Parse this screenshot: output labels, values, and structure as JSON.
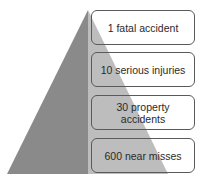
{
  "diagram": {
    "type": "safety-pyramid",
    "colors": {
      "dark": "#8a8a8a",
      "light": "#bdbdbd",
      "border": "#5a5a5a",
      "text": "#2a2a2a"
    },
    "levels": [
      {
        "label": "1 fatal accident"
      },
      {
        "label": "10 serious injuries"
      },
      {
        "label": "30 property accidents"
      },
      {
        "label": "600 near misses"
      }
    ]
  }
}
